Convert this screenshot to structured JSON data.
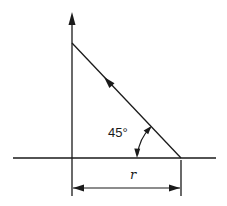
{
  "diagram": {
    "type": "geometry",
    "colors": {
      "stroke": "#1a1a1a",
      "background": "#ffffff"
    },
    "labels": {
      "angle": "45°",
      "dimension": "r"
    },
    "geometry": {
      "vertical_axis": {
        "x": 72,
        "y_top": 12,
        "y_bottom": 196
      },
      "baseline": {
        "y": 158,
        "x_left": 13,
        "x_right": 216
      },
      "diagonal": {
        "from": [
          181,
          158
        ],
        "to": [
          72,
          43
        ],
        "arrow_at": [
          106,
          79
        ]
      },
      "angle_arc": {
        "center": [
          181,
          158
        ],
        "radius": 44,
        "degrees": 45
      },
      "dimension_line": {
        "y": 188,
        "x_left": 72,
        "x_right": 181,
        "tick_right_top": 160,
        "tick_right_bottom": 196
      }
    }
  }
}
